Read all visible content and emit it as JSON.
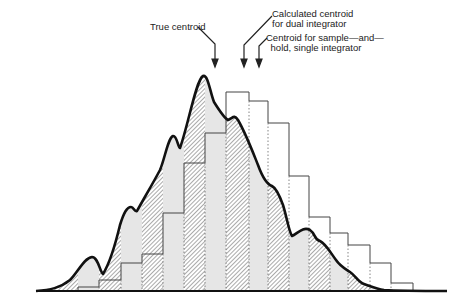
{
  "diagram": {
    "labels": {
      "true_centroid": "True centroid",
      "dual_integrator_line1": "Calculated centroid",
      "dual_integrator_line2": "for dual integrator",
      "sample_hold_line1": "Centroid for sample—and—",
      "sample_hold_line2": "hold, single integrator"
    },
    "colors": {
      "curve": "#111111",
      "bar_outline": "#444444",
      "hatch": "#555555",
      "light_fill": "#e6e6e6",
      "background": "#ffffff"
    },
    "baseline_y": 291,
    "histogram_bars": [
      {
        "x0": 78,
        "x1": 99,
        "top": 287,
        "fill": "light"
      },
      {
        "x0": 99,
        "x1": 121,
        "top": 280,
        "fill": "hatch"
      },
      {
        "x0": 121,
        "x1": 142,
        "top": 263,
        "fill": "light"
      },
      {
        "x0": 142,
        "x1": 163,
        "top": 254,
        "fill": "hatch"
      },
      {
        "x0": 163,
        "x1": 184,
        "top": 213,
        "fill": "light"
      },
      {
        "x0": 184,
        "x1": 205,
        "top": 163,
        "fill": "hatch"
      },
      {
        "x0": 205,
        "x1": 226,
        "top": 133,
        "fill": "light"
      },
      {
        "x0": 226,
        "x1": 249,
        "top": 92,
        "fill": "hatch"
      },
      {
        "x0": 249,
        "x1": 268,
        "top": 101,
        "fill": "light"
      },
      {
        "x0": 268,
        "x1": 289,
        "top": 123,
        "fill": "hatch"
      },
      {
        "x0": 289,
        "x1": 309,
        "top": 176,
        "fill": "light"
      },
      {
        "x0": 309,
        "x1": 330,
        "top": 217,
        "fill": "hatch"
      },
      {
        "x0": 330,
        "x1": 348,
        "top": 233,
        "fill": "light"
      },
      {
        "x0": 348,
        "x1": 370,
        "top": 245,
        "fill": "hatch"
      },
      {
        "x0": 370,
        "x1": 391,
        "top": 263,
        "fill": "light"
      },
      {
        "x0": 391,
        "x1": 413,
        "top": 283,
        "fill": "hatch"
      }
    ],
    "arrows": [
      {
        "name": "true-centroid-arrow",
        "x": 215,
        "tip_y": 66
      },
      {
        "name": "dual-integrator-arrow",
        "x": 244,
        "tip_y": 66
      },
      {
        "name": "sample-hold-arrow",
        "x": 259,
        "tip_y": 66
      }
    ]
  }
}
